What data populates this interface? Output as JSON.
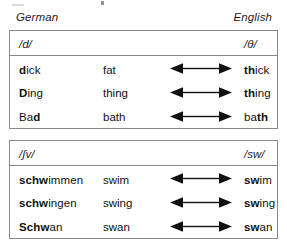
{
  "headers": {
    "left_label": "German",
    "right_label": "English"
  },
  "arrow": {
    "icon": "double-headed-arrow-icon"
  },
  "tables": [
    {
      "id": "d-theta",
      "header": {
        "german_phoneme": "/d/",
        "english_phoneme": "/θ/"
      },
      "rows": [
        {
          "german_bold": "d",
          "german_rest": "ick",
          "german_full": "dick",
          "gloss": "fat",
          "english_bold": "th",
          "english_rest": "ick",
          "english_full": "thick"
        },
        {
          "german_bold": "D",
          "german_rest": "ing",
          "german_full": "Ding",
          "gloss": "thing",
          "english_bold": "th",
          "english_rest": "ing",
          "english_full": "thing"
        },
        {
          "german_bold": "Ba",
          "german_rest": "d",
          "german_full": "Bad",
          "gloss": "bath",
          "english_bold": "ba",
          "english_rest": "th",
          "english_full": "bath"
        }
      ]
    },
    {
      "id": "shv-sw",
      "header": {
        "german_phoneme": "/ʃv/",
        "english_phoneme": "/sw/"
      },
      "rows": [
        {
          "german_bold": "schw",
          "german_rest": "immen",
          "german_full": "schwimmen",
          "gloss": "swim",
          "english_bold": "sw",
          "english_rest": "im",
          "english_full": "swim"
        },
        {
          "german_bold": "schw",
          "german_rest": "ingen",
          "german_full": "schwingen",
          "gloss": "swing",
          "english_bold": "sw",
          "english_rest": "ing",
          "english_full": "swing"
        },
        {
          "german_bold": "Schw",
          "german_rest": "an",
          "german_full": "Schwan",
          "gloss": "swan",
          "english_bold": "sw",
          "english_rest": "an",
          "english_full": "swan"
        }
      ]
    }
  ],
  "colors": {
    "border": "#8a8a8a",
    "text": "#111111",
    "background": "#ffffff"
  }
}
